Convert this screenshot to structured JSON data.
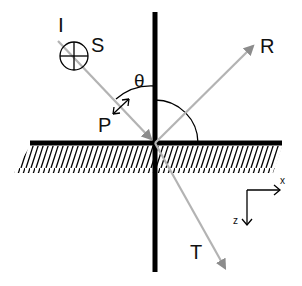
{
  "diagram": {
    "labels": {
      "incident": "I",
      "s_polarization": "S",
      "p_polarization": "P",
      "angle": "θ",
      "reflected": "R",
      "transmitted": "T",
      "axis_x": "x",
      "axis_z": "z"
    },
    "colors": {
      "line": "#000000",
      "ray": "#9a9a9a",
      "background": "#ffffff"
    }
  }
}
